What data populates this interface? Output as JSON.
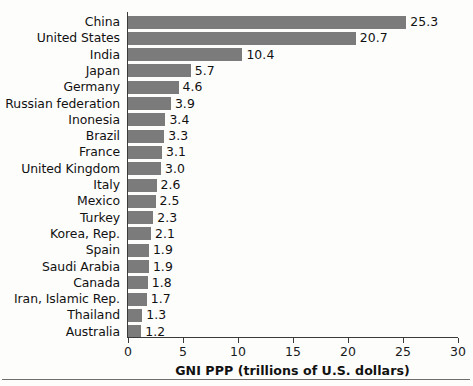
{
  "chart_data": {
    "type": "bar",
    "orientation": "horizontal",
    "title": "",
    "xlabel": "GNI PPP (trillions of U.S. dollars)",
    "ylabel": "",
    "xlim": [
      0,
      30
    ],
    "xticks": [
      0,
      5,
      10,
      15,
      20,
      25,
      30
    ],
    "grid": false,
    "legend": false,
    "bar_color": "#7b7b7b",
    "axis_color": "#3b3b3b",
    "categories": [
      "China",
      "United States",
      "India",
      "Japan",
      "Germany",
      "Russian federation",
      "Inonesia",
      "Brazil",
      "France",
      "United Kingdom",
      "Italy",
      "Mexico",
      "Turkey",
      "Korea, Rep.",
      "Spain",
      "Saudi Arabia",
      "Canada",
      "Iran, Islamic Rep.",
      "Thailand",
      "Australia"
    ],
    "values": [
      25.3,
      20.7,
      10.4,
      5.7,
      4.6,
      3.9,
      3.4,
      3.3,
      3.1,
      3.0,
      2.6,
      2.5,
      2.3,
      2.1,
      1.9,
      1.9,
      1.8,
      1.7,
      1.3,
      1.2
    ],
    "value_labels": [
      "25.3",
      "20.7",
      "10.4",
      "5.7",
      "4.6",
      "3.9",
      "3.4",
      "3.3",
      "3.1",
      "3.0",
      "2.6",
      "2.5",
      "2.3",
      "2.1",
      "1.9",
      "1.9",
      "1.8",
      "1.7",
      "1.3",
      "1.2"
    ],
    "tick_labels": [
      "0",
      "5",
      "10",
      "15",
      "20",
      "25",
      "30"
    ]
  }
}
